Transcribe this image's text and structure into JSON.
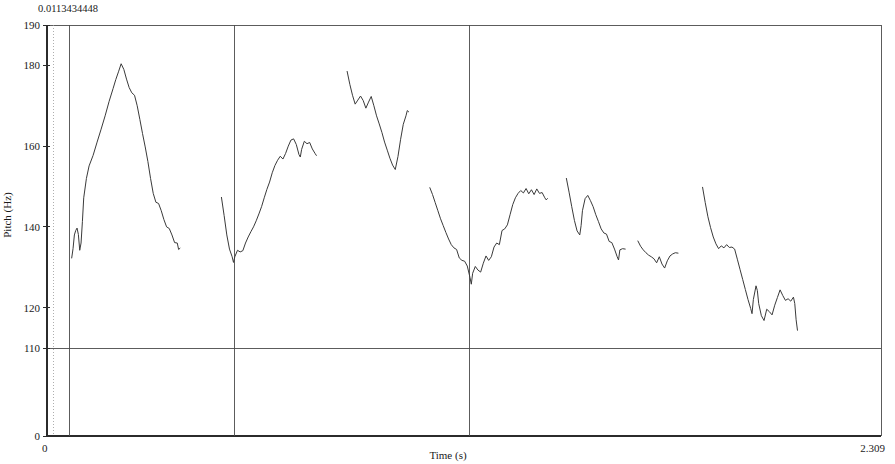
{
  "chart_data": {
    "type": "line",
    "title": "",
    "subtitle": "",
    "xlabel": "Time (s)",
    "ylabel": "Pitch (Hz)",
    "xlim": [
      0,
      2.309
    ],
    "ylim": [
      0,
      190
    ],
    "grid": false,
    "legend_position": "none",
    "corner_annotation": "0.0113434448",
    "y_ticks": [
      {
        "value": 190,
        "label": "190"
      },
      {
        "value": 180,
        "label": "180"
      },
      {
        "value": 160,
        "label": "160"
      },
      {
        "value": 140,
        "label": "140"
      },
      {
        "value": 120,
        "label": "120"
      },
      {
        "value": 110,
        "label": "110"
      },
      {
        "value": 0,
        "label": "0"
      }
    ],
    "x_ticks": [
      {
        "value": 0,
        "label": "0"
      },
      {
        "value": 2.309,
        "label": "2.309"
      }
    ],
    "reference_lines": [
      {
        "orientation": "horizontal",
        "value": 110,
        "style": "solid"
      }
    ],
    "segment_boundaries": [
      0.0615,
      0.5195,
      1.17
    ],
    "annotations": [
      {
        "text": "Aruaku!",
        "x_center": 0.2905,
        "y_position": 47
      },
      {
        "text": "Nno kolto,",
        "x_center": 0.845,
        "y_position": 47
      },
      {
        "text": "nao kam'eltapula.",
        "x_center": 1.74,
        "y_position": 47
      }
    ],
    "series": [
      {
        "name": "pitch-contour-aruaku",
        "points": [
          [
            0.0684,
            132.3
          ],
          [
            0.0721,
            134.6
          ],
          [
            0.0758,
            138.0
          ],
          [
            0.0795,
            139.1
          ],
          [
            0.0832,
            139.7
          ],
          [
            0.0869,
            138.1
          ],
          [
            0.0906,
            134.2
          ],
          [
            0.0943,
            136.0
          ],
          [
            0.098,
            141.3
          ],
          [
            0.1017,
            147.2
          ],
          [
            0.1091,
            152.0
          ],
          [
            0.1165,
            155.1
          ],
          [
            0.1276,
            157.7
          ],
          [
            0.1387,
            161.0
          ],
          [
            0.1498,
            164.2
          ],
          [
            0.1609,
            167.5
          ],
          [
            0.172,
            171.1
          ],
          [
            0.1831,
            174.3
          ],
          [
            0.1905,
            176.5
          ],
          [
            0.1979,
            178.4
          ],
          [
            0.2053,
            180.4
          ],
          [
            0.2127,
            179.0
          ],
          [
            0.2201,
            176.6
          ],
          [
            0.2275,
            174.5
          ],
          [
            0.2349,
            173.2
          ],
          [
            0.2423,
            172.6
          ],
          [
            0.2497,
            170.0
          ],
          [
            0.2571,
            166.6
          ],
          [
            0.2645,
            163.1
          ],
          [
            0.2719,
            159.8
          ],
          [
            0.2793,
            156.2
          ],
          [
            0.2867,
            152.0
          ],
          [
            0.2941,
            148.3
          ],
          [
            0.3015,
            146.1
          ],
          [
            0.3089,
            145.8
          ],
          [
            0.3163,
            144.0
          ],
          [
            0.3237,
            141.8
          ],
          [
            0.3311,
            140.0
          ],
          [
            0.3385,
            139.6
          ],
          [
            0.3459,
            138.0
          ],
          [
            0.3533,
            136.1
          ],
          [
            0.3607,
            136.0
          ],
          [
            0.3644,
            134.4
          ],
          [
            0.3681,
            134.7
          ]
        ]
      },
      {
        "name": "pitch-contour-nno-rise",
        "points": [
          [
            0.483,
            147.3
          ],
          [
            0.4904,
            142.8
          ],
          [
            0.4978,
            138.0
          ],
          [
            0.5052,
            134.5
          ],
          [
            0.5126,
            132.6
          ],
          [
            0.5163,
            131.2
          ],
          [
            0.52,
            132.6
          ],
          [
            0.5274,
            134.2
          ],
          [
            0.5348,
            133.8
          ],
          [
            0.5422,
            134.1
          ],
          [
            0.5496,
            136.0
          ],
          [
            0.557,
            137.5
          ],
          [
            0.5644,
            138.8
          ],
          [
            0.5718,
            140.0
          ],
          [
            0.5792,
            141.5
          ],
          [
            0.5866,
            143.2
          ],
          [
            0.594,
            145.0
          ],
          [
            0.6014,
            147.2
          ],
          [
            0.6088,
            149.3
          ],
          [
            0.6162,
            151.1
          ],
          [
            0.6236,
            153.4
          ],
          [
            0.631,
            155.2
          ],
          [
            0.6384,
            156.5
          ],
          [
            0.6458,
            157.5
          ],
          [
            0.6532,
            156.8
          ],
          [
            0.6606,
            158.2
          ],
          [
            0.668,
            160.0
          ],
          [
            0.6754,
            161.5
          ],
          [
            0.6828,
            161.8
          ],
          [
            0.6902,
            160.4
          ],
          [
            0.6976,
            157.9
          ],
          [
            0.7013,
            157.3
          ],
          [
            0.705,
            159.2
          ],
          [
            0.7124,
            161.2
          ],
          [
            0.7198,
            160.6
          ],
          [
            0.7272,
            160.9
          ],
          [
            0.7346,
            159.3
          ],
          [
            0.742,
            158.2
          ],
          [
            0.7457,
            157.7
          ]
        ]
      },
      {
        "name": "pitch-contour-nno-high",
        "points": [
          [
            0.831,
            178.5
          ],
          [
            0.8384,
            175.3
          ],
          [
            0.8458,
            172.6
          ],
          [
            0.8532,
            170.4
          ],
          [
            0.8606,
            171.4
          ],
          [
            0.868,
            172.4
          ],
          [
            0.8754,
            171.3
          ],
          [
            0.8828,
            169.4
          ],
          [
            0.8902,
            170.9
          ],
          [
            0.8976,
            172.3
          ],
          [
            0.905,
            170.0
          ],
          [
            0.9124,
            167.5
          ],
          [
            0.9198,
            165.5
          ],
          [
            0.9272,
            163.4
          ],
          [
            0.9346,
            161.0
          ],
          [
            0.942,
            159.0
          ],
          [
            0.9494,
            157.0
          ],
          [
            0.9568,
            155.3
          ],
          [
            0.9642,
            154.2
          ],
          [
            0.9716,
            157.4
          ],
          [
            0.979,
            161.7
          ],
          [
            0.9864,
            165.4
          ],
          [
            0.9938,
            167.5
          ],
          [
            0.9975,
            168.8
          ],
          [
            1.0012,
            168.5
          ]
        ]
      },
      {
        "name": "pitch-contour-nno-fall",
        "points": [
          [
            1.06,
            149.7
          ],
          [
            1.0674,
            148.0
          ],
          [
            1.0748,
            146.0
          ],
          [
            1.0822,
            144.0
          ],
          [
            1.0896,
            142.0
          ],
          [
            1.097,
            140.3
          ],
          [
            1.1044,
            138.6
          ],
          [
            1.1118,
            137.0
          ],
          [
            1.1192,
            135.6
          ],
          [
            1.1266,
            134.8
          ],
          [
            1.134,
            134.4
          ],
          [
            1.1414,
            132.3
          ],
          [
            1.1488,
            131.7
          ],
          [
            1.1562,
            131.5
          ],
          [
            1.1636,
            130.3
          ],
          [
            1.171,
            127.5
          ],
          [
            1.1747,
            125.8
          ],
          [
            1.1784,
            128.5
          ],
          [
            1.1858,
            130.2
          ],
          [
            1.1932,
            129.3
          ],
          [
            1.2006,
            128.8
          ],
          [
            1.208,
            131.0
          ],
          [
            1.2154,
            132.8
          ],
          [
            1.2228,
            131.7
          ],
          [
            1.2302,
            132.6
          ],
          [
            1.2376,
            135.0
          ],
          [
            1.245,
            136.0
          ],
          [
            1.2524,
            135.6
          ],
          [
            1.2598,
            139.1
          ],
          [
            1.2672,
            139.5
          ],
          [
            1.2746,
            140.5
          ],
          [
            1.282,
            143.0
          ],
          [
            1.2894,
            145.5
          ],
          [
            1.2968,
            147.2
          ],
          [
            1.3042,
            148.3
          ],
          [
            1.3116,
            149.0
          ],
          [
            1.319,
            148.4
          ],
          [
            1.3264,
            149.5
          ],
          [
            1.3338,
            148.2
          ],
          [
            1.3412,
            149.2
          ],
          [
            1.3486,
            148.0
          ],
          [
            1.356,
            149.4
          ],
          [
            1.3634,
            148.3
          ],
          [
            1.3708,
            148.5
          ],
          [
            1.3782,
            147.2
          ],
          [
            1.3819,
            146.7
          ],
          [
            1.3856,
            147.0
          ]
        ]
      },
      {
        "name": "pitch-contour-nao-1",
        "points": [
          [
            1.438,
            152.0
          ],
          [
            1.4454,
            148.6
          ],
          [
            1.4528,
            145.0
          ],
          [
            1.4602,
            141.6
          ],
          [
            1.4676,
            139.0
          ],
          [
            1.475,
            138.0
          ],
          [
            1.4787,
            140.3
          ],
          [
            1.4824,
            144.0
          ],
          [
            1.4898,
            147.0
          ],
          [
            1.4972,
            147.8
          ],
          [
            1.5046,
            146.5
          ],
          [
            1.512,
            145.0
          ],
          [
            1.5194,
            143.0
          ],
          [
            1.5268,
            141.3
          ],
          [
            1.5342,
            139.5
          ],
          [
            1.5416,
            138.5
          ],
          [
            1.549,
            138.2
          ],
          [
            1.5564,
            136.4
          ],
          [
            1.5638,
            136.1
          ],
          [
            1.5712,
            134.5
          ],
          [
            1.5786,
            132.6
          ],
          [
            1.5823,
            131.8
          ],
          [
            1.586,
            134.3
          ],
          [
            1.5934,
            134.6
          ],
          [
            1.6008,
            134.5
          ]
        ]
      },
      {
        "name": "pitch-contour-nao-2",
        "points": [
          [
            1.636,
            136.5
          ],
          [
            1.6434,
            135.2
          ],
          [
            1.6508,
            134.3
          ],
          [
            1.6582,
            133.6
          ],
          [
            1.6656,
            133.0
          ],
          [
            1.673,
            132.6
          ],
          [
            1.6804,
            132.1
          ],
          [
            1.6878,
            131.1
          ],
          [
            1.6952,
            132.6
          ],
          [
            1.7026,
            130.8
          ],
          [
            1.71,
            129.8
          ],
          [
            1.7174,
            131.6
          ],
          [
            1.7248,
            132.8
          ],
          [
            1.7322,
            133.3
          ],
          [
            1.7396,
            133.6
          ],
          [
            1.747,
            133.5
          ]
        ]
      },
      {
        "name": "pitch-contour-nao-final",
        "points": [
          [
            1.815,
            149.8
          ],
          [
            1.8224,
            146.0
          ],
          [
            1.8298,
            142.5
          ],
          [
            1.8372,
            139.8
          ],
          [
            1.8446,
            137.5
          ],
          [
            1.852,
            135.8
          ],
          [
            1.8594,
            134.6
          ],
          [
            1.8668,
            135.3
          ],
          [
            1.8742,
            134.8
          ],
          [
            1.8816,
            135.6
          ],
          [
            1.889,
            134.9
          ],
          [
            1.8964,
            135.0
          ],
          [
            1.9038,
            134.5
          ],
          [
            1.9112,
            132.0
          ],
          [
            1.9186,
            129.5
          ],
          [
            1.926,
            127.0
          ],
          [
            1.9334,
            124.5
          ],
          [
            1.9408,
            122.0
          ],
          [
            1.9482,
            119.8
          ],
          [
            1.9519,
            118.5
          ],
          [
            1.9556,
            122.0
          ],
          [
            1.963,
            125.4
          ],
          [
            1.9667,
            124.2
          ],
          [
            1.9704,
            121.0
          ],
          [
            1.9778,
            118.0
          ],
          [
            1.9852,
            116.8
          ],
          [
            1.9926,
            119.6
          ],
          [
            2.0,
            119.0
          ],
          [
            2.0074,
            118.2
          ],
          [
            2.0148,
            120.6
          ],
          [
            2.0222,
            122.5
          ],
          [
            2.0296,
            124.4
          ],
          [
            2.037,
            123.0
          ],
          [
            2.0444,
            121.8
          ],
          [
            2.0518,
            122.2
          ],
          [
            2.0592,
            121.6
          ],
          [
            2.0666,
            122.6
          ],
          [
            2.0703,
            121.0
          ],
          [
            2.074,
            117.0
          ],
          [
            2.0777,
            114.4
          ]
        ]
      }
    ]
  }
}
